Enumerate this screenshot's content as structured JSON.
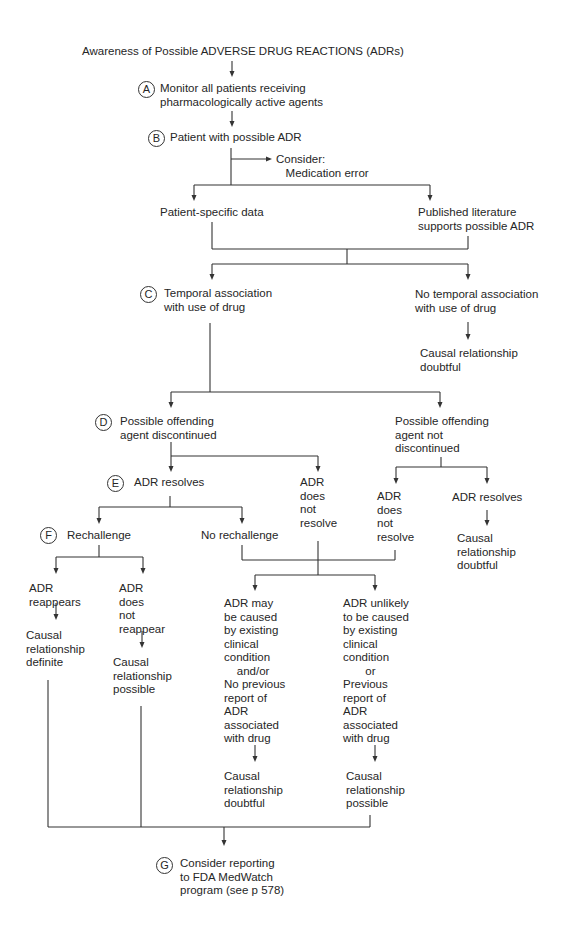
{
  "title": "Awareness of Possible ADVERSE DRUG REACTIONS (ADRs)",
  "nodes": {
    "A": {
      "badge": "A",
      "text": "Monitor all patients receiving\npharmacologically active agents"
    },
    "B": {
      "badge": "B",
      "text": "Patient with possible ADR"
    },
    "consider": {
      "text": "Consider:\n   Medication error"
    },
    "patient_data": {
      "text": "Patient-specific data"
    },
    "literature": {
      "text": "Published literature\nsupports possible ADR"
    },
    "C": {
      "badge": "C",
      "text": "Temporal association\nwith use of drug"
    },
    "no_temporal": {
      "text": "No temporal association\nwith use of drug"
    },
    "no_temporal_result": {
      "text": "Causal relationship\ndoubtful"
    },
    "D": {
      "badge": "D",
      "text": "Possible offending\nagent discontinued"
    },
    "not_discontinued": {
      "text": "Possible offending\nagent not\ndiscontinued"
    },
    "E": {
      "badge": "E",
      "text": "ADR resolves"
    },
    "d_not_resolve": {
      "text": "ADR\ndoes\nnot\nresolve"
    },
    "nd_not_resolve": {
      "text": "ADR\ndoes\nnot\nresolve"
    },
    "nd_resolves": {
      "text": "ADR resolves"
    },
    "nd_resolves_result": {
      "text": "Causal\nrelationship\ndoubtful"
    },
    "F": {
      "badge": "F",
      "text": "Rechallenge"
    },
    "no_rechallenge": {
      "text": "No rechallenge"
    },
    "reappears": {
      "text": "ADR\nreappears"
    },
    "reappears_result": {
      "text": "Causal\nrelationship\ndefinite"
    },
    "not_reappear": {
      "text": "ADR\ndoes\nnot\nreappear"
    },
    "not_reappear_result": {
      "text": "Causal\nrelationship\npossible"
    },
    "may_be_caused": {
      "text": "ADR may\nbe caused\nby existing\nclinical\ncondition\n    and/or\nNo previous\nreport of\nADR\nassociated\nwith drug"
    },
    "may_be_caused_result": {
      "text": "Causal\nrelationship\ndoubtful"
    },
    "unlikely": {
      "text": "ADR unlikely\nto be caused\nby existing\nclinical\ncondition\n       or\nPrevious\nreport of\nADR\nassociated\nwith drug"
    },
    "unlikely_result": {
      "text": "Causal\nrelationship\npossible"
    },
    "G": {
      "badge": "G",
      "text": "Consider reporting\nto FDA MedWatch\nprogram (see p 578)"
    }
  },
  "colors": {
    "line": "#333333",
    "text": "#262626",
    "background": "#ffffff"
  }
}
